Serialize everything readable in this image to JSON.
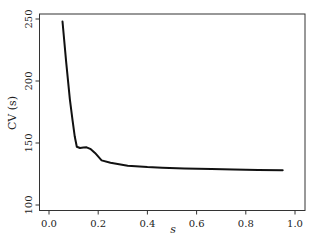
{
  "chart_data": {
    "type": "line",
    "title": "",
    "xlabel": "s",
    "ylabel": "CV (s)",
    "xlim": [
      -0.04,
      1.04
    ],
    "ylim": [
      97,
      253
    ],
    "xticks": [
      0.0,
      0.2,
      0.4,
      0.6,
      0.8,
      1.0
    ],
    "xtick_labels": [
      "0.0",
      "0.2",
      "0.4",
      "0.6",
      "0.8",
      "1.0"
    ],
    "yticks": [
      100,
      150,
      200,
      250
    ],
    "ytick_labels": [
      "100",
      "150",
      "200",
      "250"
    ],
    "grid": false,
    "legend": null,
    "series": [
      {
        "name": "CV(s)",
        "color": "#111111",
        "x": [
          0.055,
          0.07,
          0.085,
          0.096,
          0.105,
          0.113,
          0.126,
          0.14,
          0.153,
          0.17,
          0.187,
          0.214,
          0.25,
          0.32,
          0.4,
          0.46,
          0.55,
          0.66,
          0.75,
          0.85,
          0.95
        ],
        "y": [
          248,
          215,
          185,
          168,
          155,
          147,
          146,
          146.3,
          146.5,
          145,
          142,
          136,
          134,
          131.7,
          130.6,
          130,
          129.5,
          129,
          128.7,
          128.3,
          128
        ]
      }
    ]
  }
}
